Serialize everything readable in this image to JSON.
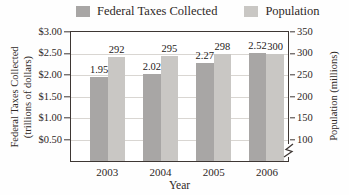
{
  "chart_data": {
    "type": "bar",
    "categories": [
      "2003",
      "2004",
      "2005",
      "2006"
    ],
    "series": [
      {
        "name": "Federal Taxes Collected",
        "axis": "left",
        "values": [
          1.95,
          2.02,
          2.27,
          2.52
        ],
        "value_labels": [
          "1.95",
          "2.02",
          "2.27",
          "2.52"
        ],
        "color": "#a8a6a5"
      },
      {
        "name": "Population",
        "axis": "right",
        "values": [
          292,
          295,
          298,
          300
        ],
        "value_labels": [
          "292",
          "295",
          "298",
          "300"
        ],
        "color": "#c9c7c4"
      }
    ],
    "left_axis": {
      "title_lines": [
        "Federal Taxes Collected",
        "(trillions of dollars)"
      ],
      "ticks": [
        "$3.00",
        "$2.50",
        "$2.00",
        "$1.50",
        "$1.00",
        "$0.50"
      ],
      "min": 0,
      "max": 3.0
    },
    "right_axis": {
      "title": "Population (millions)",
      "ticks": [
        "350",
        "300",
        "250",
        "200",
        "150",
        "100"
      ],
      "min": 100,
      "max": 350,
      "baseline_value": 50,
      "has_axis_break": true
    },
    "xlabel": "Year",
    "legend_position": "top",
    "grid": true
  }
}
